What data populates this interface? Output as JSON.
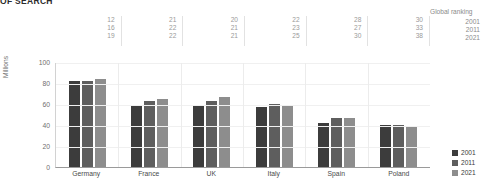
{
  "title": "OF SEARCH",
  "ranking": {
    "header": "Global ranking",
    "years": [
      "2001",
      "2011",
      "2021"
    ],
    "columns": [
      {
        "country": "Germany",
        "values": [
          "12",
          "16",
          "19"
        ]
      },
      {
        "country": "France",
        "values": [
          "21",
          "22",
          "22"
        ]
      },
      {
        "country": "UK",
        "values": [
          "20",
          "21",
          "21"
        ]
      },
      {
        "country": "Italy",
        "values": [
          "22",
          "23",
          "25"
        ]
      },
      {
        "country": "Spain",
        "values": [
          "28",
          "27",
          "30"
        ]
      },
      {
        "country": "Poland",
        "values": [
          "30",
          "33",
          "38"
        ]
      }
    ]
  },
  "legend": {
    "items": [
      {
        "label": "2001",
        "color": "#3c3c3c"
      },
      {
        "label": "2011",
        "color": "#5e5e5e"
      },
      {
        "label": "2021",
        "color": "#8d8d8d"
      }
    ]
  },
  "chart_data": {
    "type": "bar",
    "title": "OF SEARCH",
    "xlabel": "",
    "ylabel": "Millions",
    "ylim": [
      0,
      100
    ],
    "yticks": [
      0,
      20,
      40,
      60,
      80,
      100
    ],
    "grid": true,
    "legend_position": "right-bottom",
    "categories": [
      "Germany",
      "France",
      "UK",
      "Italy",
      "Spain",
      "Poland"
    ],
    "series": [
      {
        "name": "2001",
        "color": "#3c3c3c",
        "values": [
          82,
          59,
          59,
          57,
          42,
          40
        ]
      },
      {
        "name": "2011",
        "color": "#5e5e5e",
        "values": [
          82,
          63,
          63,
          60,
          47,
          40
        ]
      },
      {
        "name": "2021",
        "color": "#8d8d8d",
        "values": [
          84,
          65,
          67,
          59,
          47,
          39
        ]
      }
    ],
    "annotations": {
      "global_ranking_header": "Global ranking",
      "global_ranking": {
        "Germany": [
          12,
          16,
          19
        ],
        "France": [
          21,
          22,
          22
        ],
        "UK": [
          20,
          21,
          21
        ],
        "Italy": [
          22,
          23,
          25
        ],
        "Spain": [
          28,
          27,
          30
        ],
        "Poland": [
          30,
          33,
          38
        ]
      }
    }
  }
}
